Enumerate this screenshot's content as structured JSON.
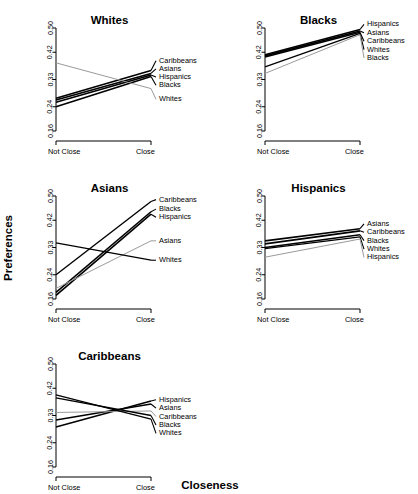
{
  "figure": {
    "xlabel": "Closeness",
    "ylabel": "Preferences"
  },
  "chart_data": {
    "type": "line",
    "title": "",
    "xlabel": "Closeness",
    "ylabel": "Preferences",
    "x": [
      "Not Close",
      "Close"
    ],
    "xlim": [
      0,
      1
    ],
    "ylim": [
      0.16,
      0.5
    ],
    "yticks": [
      0.16,
      0.24,
      0.33,
      0.42,
      0.5
    ],
    "ytick_labels": [
      "0.16",
      "0.24",
      "0.33",
      "0.42",
      "0.50"
    ],
    "grid": false,
    "legend_position": "right-inline",
    "panels": [
      {
        "title": "Whites",
        "legend_order": [
          "Caribbeans",
          "Asians",
          "Hispanics",
          "Blacks",
          "Whites"
        ],
        "series": [
          {
            "name": "Caribbeans",
            "values": [
              0.268,
              0.36
            ],
            "color": "#000000",
            "width": 1.6
          },
          {
            "name": "Asians",
            "values": [
              0.262,
              0.35
            ],
            "color": "#000000",
            "width": 1.6
          },
          {
            "name": "Hispanics",
            "values": [
              0.255,
              0.345
            ],
            "color": "#000000",
            "width": 1.6
          },
          {
            "name": "Blacks",
            "values": [
              0.24,
              0.34
            ],
            "color": "#000000",
            "width": 1.6
          },
          {
            "name": "Whites",
            "values": [
              0.385,
              0.3
            ],
            "color": "#9a9a9a",
            "width": 1.0
          }
        ]
      },
      {
        "title": "Blacks",
        "legend_order": [
          "Hispanics",
          "Asians",
          "Caribbeans",
          "Whites",
          "Blacks"
        ],
        "series": [
          {
            "name": "Hispanics",
            "values": [
              0.412,
              0.495
            ],
            "color": "#000000",
            "width": 1.6
          },
          {
            "name": "Asians",
            "values": [
              0.408,
              0.49
            ],
            "color": "#000000",
            "width": 1.6
          },
          {
            "name": "Caribbeans",
            "values": [
              0.404,
              0.486
            ],
            "color": "#000000",
            "width": 1.6
          },
          {
            "name": "Whites",
            "values": [
              0.372,
              0.482
            ],
            "color": "#000000",
            "width": 1.3
          },
          {
            "name": "Blacks",
            "values": [
              0.35,
              0.478
            ],
            "color": "#9a9a9a",
            "width": 1.0
          }
        ]
      },
      {
        "title": "Asians",
        "legend_order": [
          "Caribbeans",
          "Blacks",
          "Hispanics",
          "Asians",
          "Whites"
        ],
        "series": [
          {
            "name": "Caribbeans",
            "values": [
              0.24,
              0.482
            ],
            "color": "#000000",
            "width": 1.4
          },
          {
            "name": "Blacks",
            "values": [
              0.182,
              0.448
            ],
            "color": "#000000",
            "width": 1.6
          },
          {
            "name": "Hispanics",
            "values": [
              0.172,
              0.44
            ],
            "color": "#000000",
            "width": 1.6
          },
          {
            "name": "Asians",
            "values": [
              0.195,
              0.352
            ],
            "color": "#9a9a9a",
            "width": 1.0
          },
          {
            "name": "Whites",
            "values": [
              0.345,
              0.288
            ],
            "color": "#000000",
            "width": 1.3
          }
        ]
      },
      {
        "title": "Hispanics",
        "legend_order": [
          "Asians",
          "Caribbeans",
          "Blacks",
          "Whites",
          "Hispanics"
        ],
        "series": [
          {
            "name": "Asians",
            "values": [
              0.352,
              0.392
            ],
            "color": "#000000",
            "width": 1.6
          },
          {
            "name": "Caribbeans",
            "values": [
              0.342,
              0.385
            ],
            "color": "#000000",
            "width": 1.6
          },
          {
            "name": "Blacks",
            "values": [
              0.33,
              0.372
            ],
            "color": "#000000",
            "width": 1.6
          },
          {
            "name": "Whites",
            "values": [
              0.326,
              0.365
            ],
            "color": "#000000",
            "width": 1.3
          },
          {
            "name": "Hispanics",
            "values": [
              0.298,
              0.358
            ],
            "color": "#9a9a9a",
            "width": 1.0
          }
        ]
      },
      {
        "title": "Caribbeans",
        "legend_order": [
          "Hispanics",
          "Asians",
          "Caribbeans",
          "Blacks",
          "Whites"
        ],
        "series": [
          {
            "name": "Hispanics",
            "values": [
              0.292,
              0.378
            ],
            "color": "#000000",
            "width": 1.4
          },
          {
            "name": "Asians",
            "values": [
              0.315,
              0.368
            ],
            "color": "#000000",
            "width": 1.4
          },
          {
            "name": "Caribbeans",
            "values": [
              0.34,
              0.345
            ],
            "color": "#9a9a9a",
            "width": 1.0
          },
          {
            "name": "Blacks",
            "values": [
              0.388,
              0.33
            ],
            "color": "#000000",
            "width": 1.4
          },
          {
            "name": "Whites",
            "values": [
              0.398,
              0.318
            ],
            "color": "#000000",
            "width": 1.4
          }
        ]
      }
    ]
  }
}
